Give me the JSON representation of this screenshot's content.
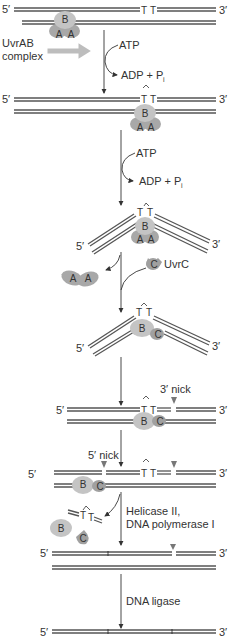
{
  "colors": {
    "strand": "#555555",
    "protein_B": "#c4c4c4",
    "protein_A": "#a8a8a8",
    "protein_C": "#a0a0a0",
    "uvrab_arrow": "#bdbdbd",
    "nick_marker": "#777777",
    "text": "#333333"
  },
  "ends": {
    "five": "5′",
    "three": "3′"
  },
  "dimer": {
    "t1": "T",
    "t2": "T"
  },
  "proteins": {
    "A": "A",
    "B": "B",
    "C": "C"
  },
  "steps": {
    "s1": {
      "complex_label_1": "UvrAB",
      "complex_label_2": "complex",
      "in": "ATP",
      "out": "ADP + P",
      "sub": "i"
    },
    "s2": {
      "in": "ATP",
      "out": "ADP + P",
      "sub": "i"
    },
    "s3": {
      "released": "A A",
      "added": "UvrC"
    },
    "s5": {
      "nick3": "3′ nick"
    },
    "s6": {
      "nick5": "5′ nick"
    },
    "s7": {
      "enzyme_1": "Helicase II,",
      "enzyme_2": "DNA polymerase I"
    },
    "s8": {
      "enzyme": "DNA ligase"
    }
  }
}
